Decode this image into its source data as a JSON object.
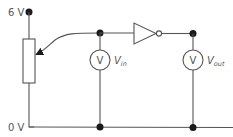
{
  "diagram": {
    "type": "circuit",
    "supply": {
      "label": "6 V"
    },
    "ground": {
      "label": "0 V"
    },
    "voltmeter_in": {
      "symbol": "V",
      "label_main": "V",
      "label_sub": "in"
    },
    "voltmeter_out": {
      "symbol": "V",
      "label_main": "V",
      "label_sub": "out"
    },
    "components": [
      "potentiometer",
      "NOT gate (inverter)",
      "voltmeter Vin",
      "voltmeter Vout"
    ],
    "colors": {
      "wire": "#555555",
      "node": "#1a1a1a",
      "text": "#555555"
    }
  }
}
